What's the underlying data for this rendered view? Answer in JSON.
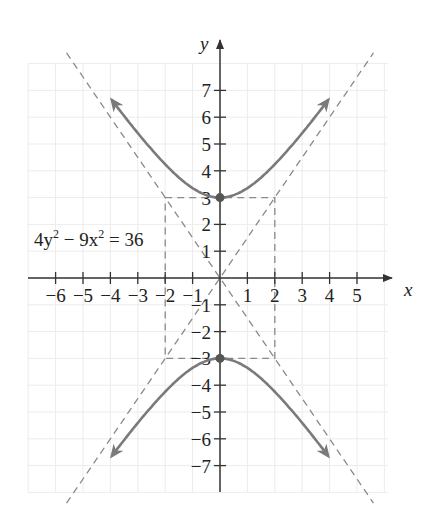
{
  "chart_data": {
    "type": "line",
    "title": "",
    "equation": "4y^2 - 9x^2 = 36",
    "equation_label": {
      "lhs_a": "4y",
      "exp1": "2",
      "minus": " − 9x",
      "exp2": "2",
      "rhs": " = 36"
    },
    "xlabel": "x",
    "ylabel": "y",
    "xlim": [
      -7,
      6
    ],
    "ylim": [
      -8,
      8
    ],
    "x_ticks": [
      -6,
      -5,
      -4,
      -3,
      -2,
      -1,
      1,
      2,
      3,
      4,
      5
    ],
    "x_tick_labels": [
      "−6",
      "−5",
      "−4",
      "−3",
      "−2",
      "−1",
      "1",
      "2",
      "3",
      "4",
      "5"
    ],
    "y_ticks": [
      7,
      6,
      5,
      4,
      3,
      2,
      1,
      -1,
      -2,
      -3,
      -4,
      -5,
      -6,
      -7
    ],
    "y_tick_labels": [
      "7",
      "6",
      "5",
      "4",
      "3",
      "2",
      "1",
      "−1",
      "−2",
      "−3",
      "−4",
      "−5",
      "−6",
      "−7"
    ],
    "grid": true,
    "series": [
      {
        "name": "upper branch",
        "style": "solid",
        "arrows": "both",
        "equation": "y = sqrt(9 + 9x^2/4)",
        "x_range": [
          -4.0,
          4.0
        ],
        "vertex": [
          0,
          3
        ]
      },
      {
        "name": "lower branch",
        "style": "solid",
        "arrows": "both",
        "equation": "y = -sqrt(9 + 9x^2/4)",
        "x_range": [
          -4.0,
          4.0
        ],
        "vertex": [
          0,
          -3
        ]
      },
      {
        "name": "asymptote y = 1.5x",
        "style": "dashed",
        "points": [
          [
            -5.6,
            -8.4
          ],
          [
            5.6,
            8.4
          ]
        ]
      },
      {
        "name": "asymptote y = -1.5x",
        "style": "dashed",
        "points": [
          [
            -5.6,
            8.4
          ],
          [
            5.6,
            -8.4
          ]
        ]
      },
      {
        "name": "fundamental rectangle",
        "style": "dashed",
        "corners": [
          [
            -2,
            3
          ],
          [
            2,
            3
          ],
          [
            2,
            -3
          ],
          [
            -2,
            -3
          ]
        ]
      }
    ],
    "vertices": [
      [
        0,
        3
      ],
      [
        0,
        -3
      ]
    ],
    "colors": {
      "curve": "#7a7a7a",
      "asymptote": "#8a8a8a",
      "axis": "#333333",
      "grid": "#ececec",
      "vertex": "#555555"
    }
  }
}
